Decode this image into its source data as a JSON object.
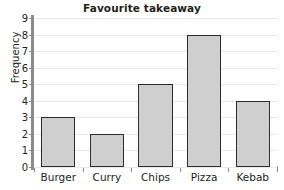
{
  "chart_data": {
    "type": "bar",
    "title": "Favourite takeaway",
    "xlabel": "",
    "ylabel": "Frequency",
    "categories": [
      "Burger",
      "Curry",
      "Chips",
      "Pizza",
      "Kebab"
    ],
    "values": [
      3,
      2,
      5,
      8,
      4
    ],
    "ylim": [
      0,
      9
    ],
    "ytick_labels": [
      "0",
      "1",
      "2",
      "3",
      "4",
      "5",
      "6",
      "7",
      "8",
      "9"
    ],
    "ytick_values": [
      0,
      1,
      2,
      3,
      4,
      5,
      6,
      7,
      8,
      9
    ],
    "grid": true,
    "legend": null,
    "colors": {
      "bar_fill": "#cfcfcf",
      "bar_border": "#2b2b2b",
      "gridline": "#e9e9ec",
      "axis": "#8b8b8e",
      "text": "#231f20",
      "background": "#ffffff"
    }
  }
}
